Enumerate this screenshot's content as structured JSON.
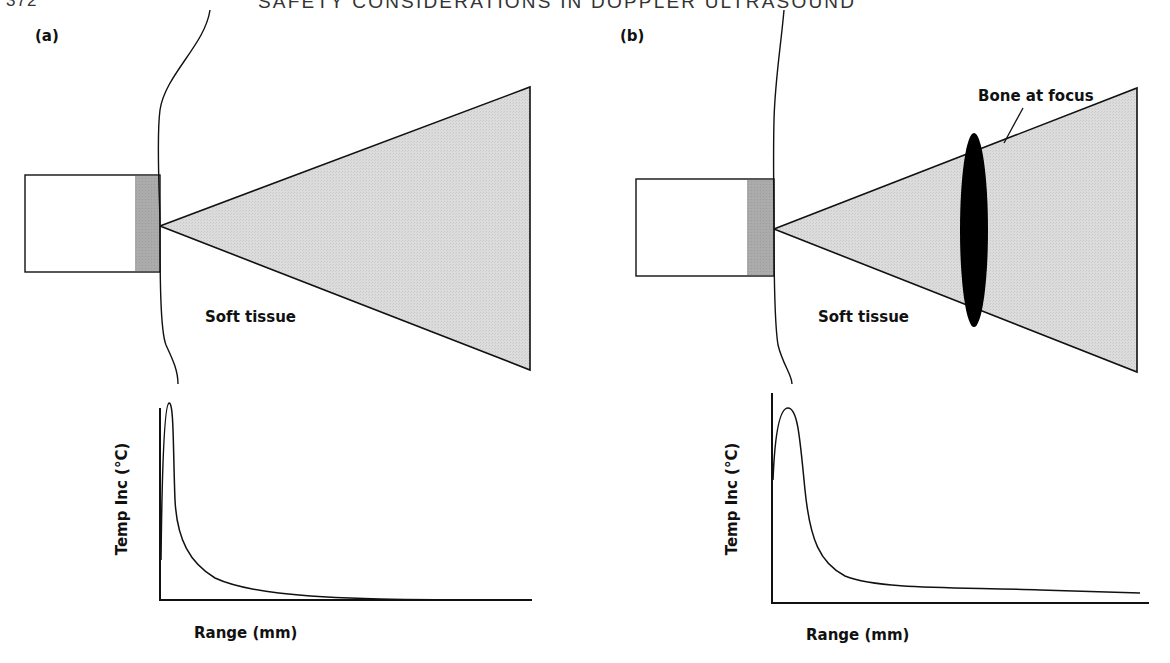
{
  "header": {
    "page_number": "372",
    "running_title": "SAFETY CONSIDERATIONS IN DOPPLER ULTRASOUND"
  },
  "colors": {
    "stroke": "#111111",
    "beam_fill": "#d9d9d9",
    "transducer_face": "#a8a8a8",
    "bone": "#000000",
    "background": "#ffffff"
  },
  "panels": [
    {
      "id": "a",
      "label": "(a)",
      "tissue_label": "Soft tissue",
      "graph": {
        "ylabel": "Temp Inc (°C)",
        "xlabel": "Range (mm)"
      }
    },
    {
      "id": "b",
      "label": "(b)",
      "tissue_label": "Soft tissue",
      "bone_label": "Bone at focus",
      "graph": {
        "ylabel": "Temp Inc (°C)",
        "xlabel": "Range (mm)"
      }
    }
  ]
}
